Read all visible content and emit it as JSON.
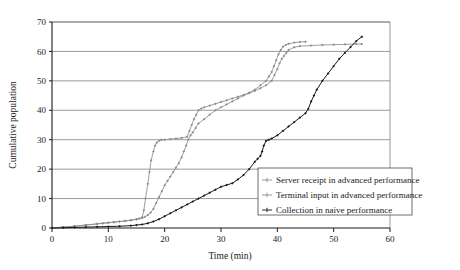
{
  "chart_data": {
    "type": "line",
    "title": "",
    "xlabel": "Time (min)",
    "ylabel": "Cumulative population",
    "xlim": [
      0,
      60
    ],
    "ylim": [
      0,
      70
    ],
    "xticks": [
      0,
      10,
      20,
      30,
      40,
      50,
      60
    ],
    "yticks": [
      0,
      10,
      20,
      30,
      40,
      50,
      60,
      70
    ],
    "grid": "horizontal",
    "legend_position": "lower-right",
    "series": [
      {
        "name": "Server receipt in advanced performance",
        "color": "#8c8c8c",
        "marker": "cross",
        "x": [
          0,
          2,
          4,
          6,
          8,
          9,
          10,
          11,
          12,
          13,
          14,
          15,
          15.5,
          16,
          16.3,
          16.6,
          17,
          17.3,
          17.6,
          18,
          18.3,
          18.6,
          19,
          19.4,
          20,
          21,
          22,
          23,
          24,
          24.4,
          24.8,
          25.2,
          25.6,
          26,
          26.5,
          27,
          28,
          29,
          30,
          31,
          32,
          33,
          34,
          35,
          36,
          37,
          38,
          38.5,
          39,
          39.4,
          39.8,
          40.2,
          40.6,
          41,
          41.5,
          42,
          43,
          44,
          45
        ],
        "y": [
          0,
          0.3,
          0.6,
          1,
          1.4,
          1.6,
          1.8,
          2,
          2.2,
          2.4,
          2.6,
          2.9,
          3.2,
          3.6,
          6,
          10,
          15,
          19,
          23,
          26,
          28,
          29,
          29.6,
          30,
          30,
          30.2,
          30.4,
          30.6,
          31,
          33,
          35,
          37,
          38.5,
          40,
          40.6,
          41,
          41.6,
          42.2,
          42.8,
          43.4,
          44,
          44.6,
          45.2,
          46,
          47,
          48.5,
          50,
          51.5,
          53,
          55,
          57,
          59,
          60.5,
          61.6,
          62.2,
          62.6,
          63,
          63.2,
          63.3
        ]
      },
      {
        "name": "Terminal input in advanced performance",
        "color": "#8c8c8c",
        "marker": "cross",
        "x": [
          0,
          2,
          4,
          6,
          8,
          9,
          10,
          11,
          12,
          13,
          14,
          15,
          16,
          16.5,
          17,
          17.5,
          18,
          18.5,
          19,
          19.5,
          20,
          20.5,
          21,
          21.5,
          22,
          22.5,
          23,
          23.4,
          23.8,
          24.2,
          24.6,
          25,
          25.5,
          26,
          27,
          28,
          29,
          30,
          31,
          32,
          33,
          34,
          35,
          36,
          37,
          38,
          39,
          39.5,
          40,
          40.4,
          40.8,
          41.2,
          41.6,
          42,
          43,
          44,
          46,
          48,
          50,
          52,
          54,
          55
        ],
        "y": [
          0,
          0.3,
          0.6,
          1,
          1.4,
          1.6,
          1.8,
          2,
          2.2,
          2.4,
          2.7,
          3,
          3.4,
          3.8,
          4.4,
          5.2,
          6.5,
          8.5,
          10.5,
          12.5,
          14.5,
          16,
          17.5,
          19,
          20.5,
          22,
          24,
          26,
          28,
          30,
          31.5,
          32.5,
          34,
          35.5,
          37,
          38.5,
          40,
          41,
          42,
          43,
          44,
          45,
          45.8,
          46.6,
          47.5,
          48.5,
          50,
          52,
          54,
          56,
          57.5,
          58.5,
          59.5,
          60.5,
          61.4,
          61.8,
          62,
          62.2,
          62.3,
          62.4,
          62.5,
          62.5
        ]
      },
      {
        "name": "Collection in naive performance",
        "color": "#1a1a1a",
        "marker": "cross",
        "x": [
          0,
          2,
          4,
          6,
          8,
          10,
          12,
          14,
          15,
          16,
          17,
          18,
          19,
          20,
          21,
          22,
          23,
          24,
          25,
          26,
          27,
          28,
          29,
          30,
          31,
          32,
          33,
          34,
          35,
          36,
          36.5,
          37,
          37.3,
          37.6,
          38,
          38.5,
          39,
          40,
          41,
          42,
          43,
          44,
          45,
          45.5,
          46,
          46.5,
          47,
          48,
          49,
          50,
          51,
          52,
          53,
          54,
          55
        ],
        "y": [
          0,
          0.1,
          0.2,
          0.3,
          0.4,
          0.5,
          0.6,
          0.8,
          1,
          1.2,
          1.6,
          2.2,
          3,
          4,
          5,
          6,
          7,
          8,
          9,
          10,
          11,
          12,
          13,
          14,
          14.6,
          15.2,
          16.5,
          18,
          20,
          22.5,
          23.5,
          24.5,
          26,
          28,
          29.6,
          30,
          30.4,
          31.5,
          33,
          34.5,
          36,
          37.5,
          39,
          40.5,
          43,
          45,
          47,
          50,
          52.5,
          55,
          57.5,
          59.5,
          61.5,
          63.5,
          65
        ]
      }
    ]
  },
  "legend": {
    "entries": [
      {
        "label": "Server receipt in advanced performance"
      },
      {
        "label": "Terminal input in advanced performance"
      },
      {
        "label": "Collection in naive performance"
      }
    ]
  }
}
